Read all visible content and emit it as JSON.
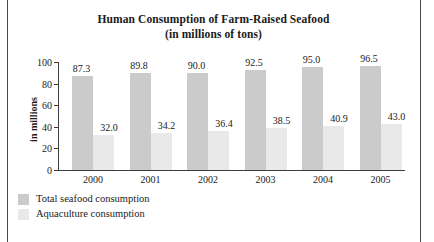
{
  "figure": {
    "frame_color": "#4a4a4a",
    "background": "#ffffff"
  },
  "title": {
    "line1": "Human Consumption of Farm-Raised Seafood",
    "line2": "(in millions of tons)"
  },
  "axes": {
    "ylabel": "in millions",
    "ytick_labels": [
      "100",
      "80",
      "60",
      "40",
      "20",
      "0"
    ],
    "xtick_labels": [
      "2000",
      "2001",
      "2002",
      "2003",
      "2004",
      "2005"
    ]
  },
  "legend": {
    "items": [
      {
        "label": "Total seafood consumption",
        "color": "#cbcbcb"
      },
      {
        "label": "Aquaculture consumption",
        "color": "#e9e9e9"
      }
    ]
  },
  "values": {
    "total": [
      "87.3",
      "89.8",
      "90.0",
      "92.5",
      "95.0",
      "96.5"
    ],
    "aqua": [
      "32.0",
      "34.2",
      "36.4",
      "38.5",
      "40.9",
      "43.0"
    ]
  },
  "chart_data": {
    "type": "bar",
    "title": "Human Consumption of Farm-Raised Seafood (in millions of tons)",
    "xlabel": "",
    "ylabel": "in millions",
    "categories": [
      "2000",
      "2001",
      "2002",
      "2003",
      "2004",
      "2005"
    ],
    "series": [
      {
        "name": "Total seafood consumption",
        "color": "#cbcbcb",
        "values": [
          87.3,
          89.8,
          90.0,
          92.5,
          95.0,
          96.5
        ]
      },
      {
        "name": "Aquaculture consumption",
        "color": "#e9e9e9",
        "values": [
          32.0,
          34.2,
          36.4,
          38.5,
          40.9,
          43.0
        ]
      }
    ],
    "ylim": [
      0,
      100
    ],
    "yticks": [
      0,
      20,
      40,
      60,
      80,
      100
    ],
    "grid": false,
    "legend_position": "below-left",
    "data_labels": true
  }
}
